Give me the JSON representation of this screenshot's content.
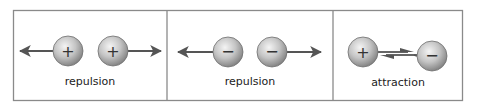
{
  "panels": [
    {
      "label": "repulsion",
      "charges": [
        "+",
        "+"
      ],
      "interaction": "repulsion"
    },
    {
      "label": "repulsion",
      "charges": [
        "−",
        "−"
      ],
      "interaction": "repulsion"
    },
    {
      "label": "attraction",
      "charges": [
        "+",
        "−"
      ],
      "interaction": "attraction"
    }
  ],
  "colors": {
    "border": "#8a8a8a",
    "arrow": "#555555",
    "sphere_light": "#f2f2f2",
    "sphere_dark": "#8c8c8c",
    "sign": "#333333"
  }
}
